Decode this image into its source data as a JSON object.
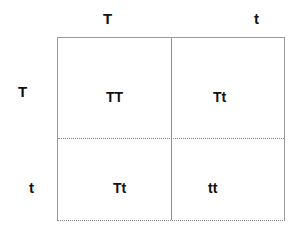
{
  "punnett_square": {
    "columns": [
      "T",
      "t"
    ],
    "rows": [
      "T",
      "t"
    ],
    "cells": [
      [
        "TT",
        "Tt"
      ],
      [
        "Tt",
        "tt"
      ]
    ]
  }
}
